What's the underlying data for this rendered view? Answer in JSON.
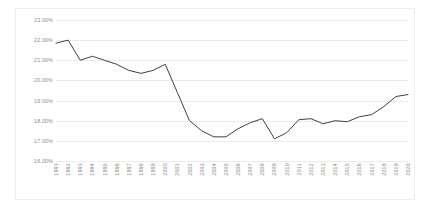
{
  "chart_data": {
    "type": "line",
    "title": "",
    "subtitle": "",
    "xlabel": "",
    "ylabel": "",
    "legend": [],
    "legend_position": "none",
    "grid": true,
    "grid_axis": "y",
    "line_color": "#404040",
    "background_color": "#ffffff",
    "gridline_color": "#ebebeb",
    "border_color": "#ededed",
    "tick_label_color": "#8d8d8d",
    "x_tick_rotation": 90,
    "ylim": [
      16.0,
      23.0
    ],
    "ytick_step": 1.0,
    "ytick_labels": [
      "23.00%",
      "22.00%",
      "21.00%",
      "20.00%",
      "19.00%",
      "18.00%",
      "17.00%",
      "16.00%"
    ],
    "ytick_values": [
      23.0,
      22.0,
      21.0,
      20.0,
      19.0,
      18.0,
      17.0,
      16.0
    ],
    "categories": [
      "1991",
      "1992",
      "1993",
      "1994",
      "1995",
      "1996",
      "1997",
      "1998",
      "1999",
      "2000",
      "2001",
      "2002",
      "2003",
      "2004",
      "2005",
      "2006",
      "2007",
      "2008",
      "2009",
      "2010",
      "2011",
      "2012",
      "2013",
      "2014",
      "2015",
      "2016",
      "2017",
      "2018",
      "2019",
      "2020"
    ],
    "values": [
      21.85,
      22.0,
      21.0,
      21.2,
      21.0,
      20.8,
      20.5,
      20.35,
      20.5,
      20.8,
      19.4,
      18.0,
      17.5,
      17.2,
      17.2,
      17.6,
      17.9,
      18.1,
      17.1,
      17.4,
      18.05,
      18.1,
      17.85,
      18.0,
      17.95,
      18.2,
      18.3,
      18.7,
      19.2,
      19.3
    ],
    "value_unit": "%"
  }
}
